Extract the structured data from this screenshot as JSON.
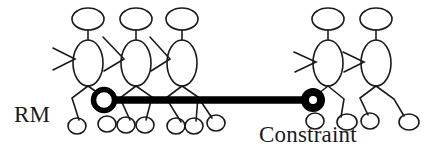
{
  "diagram": {
    "type": "stick-figure-relationship-diagram",
    "background_color": "#ffffff",
    "stroke_color": "#1a1a1a",
    "connector_color": "#000000",
    "labels": {
      "left": "RM",
      "right": "Constraint"
    },
    "connector": {
      "name": "constraint-link",
      "thickness_px": 7,
      "from": {
        "x": 104,
        "y": 100
      },
      "to": {
        "x": 313,
        "y": 100
      },
      "endpoint_shape": "ring",
      "endpoint_radius_px": 10
    },
    "groups": [
      {
        "name": "rm-group",
        "count": 3,
        "figures": [
          {
            "name": "figure-rm-1",
            "head": {
              "cx": 88,
              "cy": 19,
              "rx": 16,
              "ry": 11
            },
            "body": {
              "cx": 88,
              "cy": 63,
              "rx": 15,
              "ry": 23
            }
          },
          {
            "name": "figure-rm-2",
            "head": {
              "cx": 136,
              "cy": 19,
              "rx": 16,
              "ry": 11
            },
            "body": {
              "cx": 136,
              "cy": 63,
              "rx": 15,
              "ry": 23
            }
          },
          {
            "name": "figure-rm-3",
            "head": {
              "cx": 182,
              "cy": 19,
              "rx": 16,
              "ry": 11
            },
            "body": {
              "cx": 182,
              "cy": 63,
              "rx": 15,
              "ry": 23
            }
          }
        ]
      },
      {
        "name": "constraint-group",
        "count": 2,
        "figures": [
          {
            "name": "figure-constraint-1",
            "head": {
              "cx": 328,
              "cy": 19,
              "rx": 16,
              "ry": 11
            },
            "body": {
              "cx": 328,
              "cy": 63,
              "rx": 15,
              "ry": 23
            }
          },
          {
            "name": "figure-constraint-2",
            "head": {
              "cx": 376,
              "cy": 19,
              "rx": 16,
              "ry": 11
            },
            "body": {
              "cx": 376,
              "cy": 63,
              "rx": 15,
              "ry": 23
            }
          }
        ]
      }
    ]
  }
}
